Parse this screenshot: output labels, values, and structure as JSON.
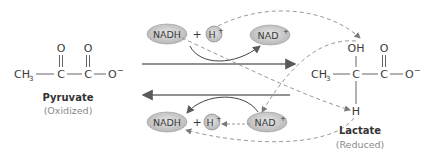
{
  "diagram": {
    "type": "chemical-reaction",
    "reactant": {
      "name": "Pyruvate",
      "state": "(Oxidized)",
      "formula_parts": [
        "CH",
        "3",
        "C",
        "C",
        "O",
        "−",
        "O",
        "O"
      ]
    },
    "product": {
      "name": "Lactate",
      "state": "(Reduced)",
      "formula_parts": [
        "CH",
        "3",
        "C",
        "C",
        "O",
        "−",
        "OH",
        "O",
        "H"
      ]
    },
    "forward_cofactors": {
      "nadh": "NADH",
      "plus": "+",
      "h_plus": "H",
      "h_plus_sup": "+",
      "nad_plus": "NAD",
      "nad_plus_sup": "+"
    },
    "reverse_cofactors": {
      "nadh": "NADH",
      "plus": "+",
      "h_plus": "H",
      "h_plus_sup": "+",
      "nad_plus": "NAD",
      "nad_plus_sup": "+"
    },
    "colors": {
      "oval_fill": "#c8c8c8",
      "arrow": "#6e6e6e",
      "dashed": "#8c8c8c",
      "text": "#3a3a3a"
    }
  }
}
